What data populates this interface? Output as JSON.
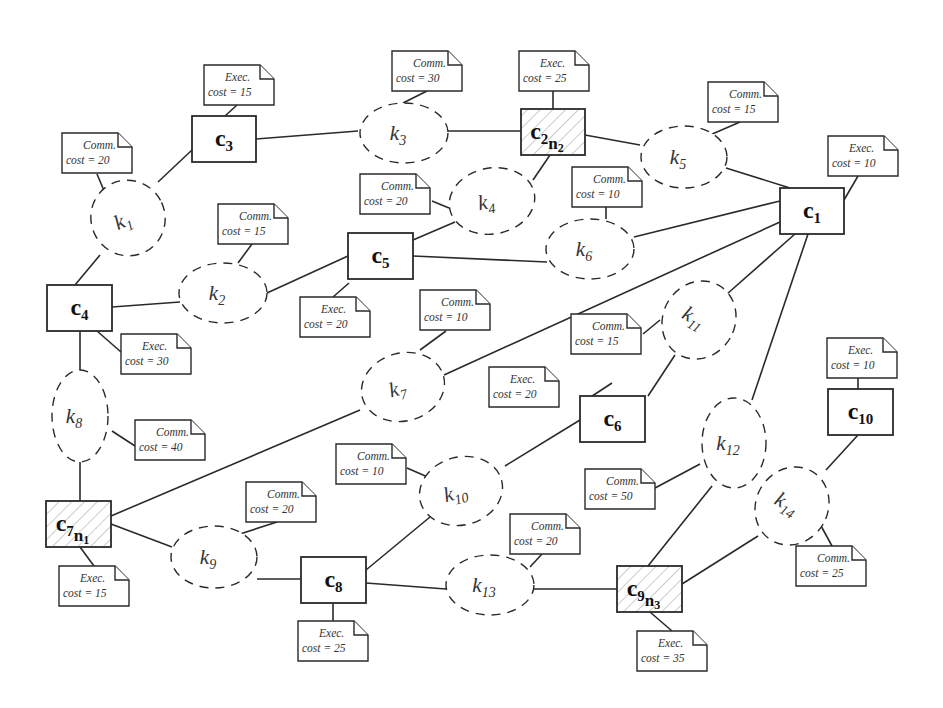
{
  "components": [
    {
      "id": "c1",
      "label": "c",
      "sub": "1",
      "x": 780,
      "y": 188,
      "w": 64,
      "h": 46,
      "hatched": false
    },
    {
      "id": "c2",
      "label": "c",
      "sub": "2",
      "node": "n",
      "nodeSub": "2",
      "x": 521,
      "y": 109,
      "w": 64,
      "h": 46,
      "hatched": true
    },
    {
      "id": "c3",
      "label": "c",
      "sub": "3",
      "x": 192,
      "y": 116,
      "w": 64,
      "h": 46,
      "hatched": false
    },
    {
      "id": "c4",
      "label": "c",
      "sub": "4",
      "x": 47,
      "y": 285,
      "w": 65,
      "h": 46,
      "hatched": false
    },
    {
      "id": "c5",
      "label": "c",
      "sub": "5",
      "x": 348,
      "y": 233,
      "w": 65,
      "h": 46,
      "hatched": false
    },
    {
      "id": "c6",
      "label": "c",
      "sub": "6",
      "x": 580,
      "y": 396,
      "w": 65,
      "h": 46,
      "hatched": false
    },
    {
      "id": "c7",
      "label": "c",
      "sub": "7",
      "node": "n",
      "nodeSub": "1",
      "x": 46,
      "y": 501,
      "w": 65,
      "h": 46,
      "hatched": true
    },
    {
      "id": "c8",
      "label": "c",
      "sub": "8",
      "x": 301,
      "y": 557,
      "w": 65,
      "h": 46,
      "hatched": false
    },
    {
      "id": "c9",
      "label": "c",
      "sub": "9",
      "node": "n",
      "nodeSub": "3",
      "x": 617,
      "y": 566,
      "w": 65,
      "h": 46,
      "hatched": true
    },
    {
      "id": "c10",
      "label": "c",
      "sub": "10",
      "x": 828,
      "y": 389,
      "w": 65,
      "h": 46,
      "hatched": false
    }
  ],
  "connectors": [
    {
      "id": "k1",
      "label": "k",
      "sub": "1",
      "cx": 128,
      "cy": 218,
      "rx": 37,
      "ry": 38,
      "rot": -25
    },
    {
      "id": "k2",
      "label": "k",
      "sub": "2",
      "cx": 223,
      "cy": 293,
      "rx": 44,
      "ry": 30,
      "rot": 0
    },
    {
      "id": "k3",
      "label": "k",
      "sub": "3",
      "cx": 404,
      "cy": 133,
      "rx": 44,
      "ry": 30,
      "rot": 0
    },
    {
      "id": "k4",
      "label": "k",
      "sub": "4",
      "cx": 492,
      "cy": 201,
      "rx": 43,
      "ry": 33,
      "rot": -10
    },
    {
      "id": "k5",
      "label": "k",
      "sub": "5",
      "cx": 684,
      "cy": 157,
      "rx": 43,
      "ry": 31,
      "rot": 0
    },
    {
      "id": "k6",
      "label": "k",
      "sub": "6",
      "cx": 590,
      "cy": 249,
      "rx": 44,
      "ry": 30,
      "rot": 0
    },
    {
      "id": "k7",
      "label": "k",
      "sub": "7",
      "cx": 403,
      "cy": 387,
      "rx": 42,
      "ry": 34,
      "rot": -15
    },
    {
      "id": "k8",
      "label": "k",
      "sub": "8",
      "cx": 80,
      "cy": 416,
      "rx": 28,
      "ry": 46,
      "rot": 0
    },
    {
      "id": "k9",
      "label": "k",
      "sub": "9",
      "cx": 214,
      "cy": 557,
      "rx": 43,
      "ry": 31,
      "rot": 0
    },
    {
      "id": "k10",
      "label": "k",
      "sub": "10",
      "cx": 461,
      "cy": 491,
      "rx": 42,
      "ry": 34,
      "rot": -15
    },
    {
      "id": "k11",
      "label": "k",
      "sub": "11",
      "cx": 699,
      "cy": 320,
      "rx": 36,
      "ry": 40,
      "rot": 30
    },
    {
      "id": "k12",
      "label": "k",
      "sub": "12",
      "cx": 734,
      "cy": 443,
      "rx": 32,
      "ry": 45,
      "rot": 0
    },
    {
      "id": "k13",
      "label": "k",
      "sub": "13",
      "cx": 490,
      "cy": 585,
      "rx": 44,
      "ry": 30,
      "rot": 0
    },
    {
      "id": "k14",
      "label": "k",
      "sub": "14",
      "cx": 792,
      "cy": 506,
      "rx": 36,
      "ry": 40,
      "rot": 30
    }
  ],
  "notes": [
    {
      "for": "c3",
      "line1": "Exec.",
      "line2": "cost = 15",
      "x": 204,
      "y": 65
    },
    {
      "for": "k3",
      "line1": "Comm.",
      "line2": "cost = 30",
      "x": 392,
      "y": 51
    },
    {
      "for": "c2",
      "line1": "Exec.",
      "line2": "cost = 25",
      "x": 519,
      "y": 51
    },
    {
      "for": "k5",
      "line1": "Comm.",
      "line2": "cost = 15",
      "x": 708,
      "y": 82
    },
    {
      "for": "c1",
      "line1": "Exec.",
      "line2": "cost = 10",
      "x": 828,
      "y": 136
    },
    {
      "for": "k1",
      "line1": "Comm.",
      "line2": "cost = 20",
      "x": 62,
      "y": 133
    },
    {
      "for": "k4",
      "line1": "Comm.",
      "line2": "cost = 20",
      "x": 360,
      "y": 174
    },
    {
      "for": "k6",
      "line1": "Comm.",
      "line2": "cost = 10",
      "x": 572,
      "y": 167
    },
    {
      "for": "k2",
      "line1": "Comm.",
      "line2": "cost = 15",
      "x": 218,
      "y": 204
    },
    {
      "for": "c5",
      "line1": "Exec.",
      "line2": "cost = 20",
      "x": 300,
      "y": 297
    },
    {
      "for": "k7",
      "line1": "Comm.",
      "line2": "cost = 10",
      "x": 420,
      "y": 290
    },
    {
      "for": "k11",
      "line1": "Comm.",
      "line2": "cost = 15",
      "x": 571,
      "y": 314
    },
    {
      "for": "c4",
      "line1": "Exec.",
      "line2": "cost = 30",
      "x": 121,
      "y": 334
    },
    {
      "for": "c6",
      "line1": "Exec.",
      "line2": "cost = 20",
      "x": 489,
      "y": 367
    },
    {
      "for": "c10",
      "line1": "Exec.",
      "line2": "cost = 10",
      "x": 827,
      "y": 338
    },
    {
      "for": "k8",
      "line1": "Comm.",
      "line2": "cost = 40",
      "x": 135,
      "y": 420
    },
    {
      "for": "k10",
      "line1": "Comm.",
      "line2": "cost = 10",
      "x": 336,
      "y": 444
    },
    {
      "for": "k12",
      "line1": "Comm.",
      "line2": "cost = 50",
      "x": 585,
      "y": 469
    },
    {
      "for": "k9",
      "line1": "Comm.",
      "line2": "cost = 20",
      "x": 246,
      "y": 482
    },
    {
      "for": "k13",
      "line1": "Comm.",
      "line2": "cost = 20",
      "x": 510,
      "y": 514
    },
    {
      "for": "k14",
      "line1": "Comm.",
      "line2": "cost = 25",
      "x": 796,
      "y": 546
    },
    {
      "for": "c7",
      "line1": "Exec.",
      "line2": "cost = 15",
      "x": 59,
      "y": 566
    },
    {
      "for": "c8",
      "line1": "Exec.",
      "line2": "cost = 25",
      "x": 298,
      "y": 621
    },
    {
      "for": "c9",
      "line1": "Exec.",
      "line2": "cost = 35",
      "x": 637,
      "y": 631
    }
  ],
  "edges": [
    [
      256,
      139,
      358,
      131
    ],
    [
      448,
      131,
      521,
      131
    ],
    [
      585,
      135,
      640,
      145
    ],
    [
      726,
      168,
      790,
      188
    ],
    [
      158,
      182,
      192,
      150
    ],
    [
      100,
      255,
      75,
      285
    ],
    [
      112,
      307,
      180,
      302
    ],
    [
      267,
      293,
      348,
      256
    ],
    [
      413,
      256,
      547,
      262
    ],
    [
      413,
      240,
      455,
      222
    ],
    [
      533,
      180,
      550,
      155
    ],
    [
      634,
      237,
      780,
      201
    ],
    [
      80,
      331,
      80,
      370
    ],
    [
      80,
      462,
      80,
      501
    ],
    [
      111,
      516,
      360,
      410
    ],
    [
      444,
      375,
      780,
      222
    ],
    [
      111,
      524,
      172,
      547
    ],
    [
      257,
      579,
      301,
      579
    ],
    [
      366,
      570,
      430,
      517
    ],
    [
      505,
      466,
      580,
      420
    ],
    [
      366,
      583,
      446,
      589
    ],
    [
      534,
      589,
      617,
      589
    ],
    [
      648,
      396,
      675,
      355
    ],
    [
      727,
      294,
      795,
      234
    ],
    [
      648,
      566,
      712,
      486
    ],
    [
      752,
      400,
      808,
      234
    ],
    [
      682,
      584,
      758,
      536
    ],
    [
      826,
      470,
      858,
      435
    ]
  ],
  "note_links": [
    [
      237,
      105,
      225,
      116
    ],
    [
      427,
      91,
      403,
      103
    ],
    [
      553,
      91,
      553,
      109
    ],
    [
      740,
      122,
      710,
      135
    ],
    [
      858,
      176,
      844,
      200
    ],
    [
      97,
      174,
      105,
      193
    ],
    [
      432,
      201,
      449,
      208
    ],
    [
      606,
      207,
      606,
      219
    ],
    [
      252,
      244,
      238,
      263
    ],
    [
      349,
      283,
      333,
      297
    ],
    [
      446,
      331,
      420,
      350
    ],
    [
      643,
      334,
      660,
      320
    ],
    [
      97,
      331,
      121,
      352
    ],
    [
      612,
      383,
      580,
      404
    ],
    [
      858,
      378,
      858,
      389
    ],
    [
      112,
      431,
      135,
      446
    ],
    [
      407,
      468,
      430,
      478
    ],
    [
      655,
      488,
      700,
      464
    ],
    [
      277,
      522,
      240,
      534
    ],
    [
      542,
      554,
      530,
      567
    ],
    [
      820,
      524,
      832,
      546
    ],
    [
      80,
      547,
      94,
      566
    ],
    [
      333,
      603,
      333,
      621
    ],
    [
      650,
      612,
      672,
      631
    ]
  ],
  "colors": {
    "ink": "#2a2a2a",
    "hatch": "#9a9a9a",
    "paper": "#ffffff"
  }
}
